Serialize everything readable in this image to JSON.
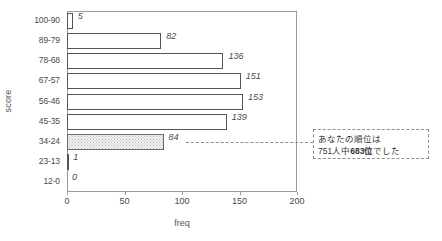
{
  "chart_data": {
    "type": "bar",
    "orientation": "horizontal",
    "title": "",
    "xlabel": "freq",
    "ylabel": "score",
    "categories": [
      "100-90",
      "89-79",
      "78-68",
      "67-57",
      "56-46",
      "45-35",
      "34-24",
      "23-13",
      "12-0"
    ],
    "values": [
      5,
      82,
      136,
      151,
      153,
      139,
      84,
      1,
      0
    ],
    "value_labels": [
      "5",
      "82",
      "136",
      "151",
      "153",
      "139",
      "84",
      "1",
      "0"
    ],
    "xlim": [
      0,
      200
    ],
    "xticks": [
      0,
      50,
      100,
      150,
      200
    ],
    "xtick_labels": [
      "0",
      "50",
      "100",
      "150",
      "200"
    ],
    "grid": false,
    "legend": null,
    "highlight_category": "34-24",
    "highlight_style": "stippled-gray-fill",
    "bar_fill": "#ffffff",
    "bar_edge": "#555555",
    "highlight_fill": "#f2f2f2",
    "annotation": {
      "line1": "あなたの順位は",
      "line2_prefix": "751人中",
      "line2_strong": "683位",
      "line2_suffix": "でした",
      "connector": "dashed-leader-line",
      "attached_to": "34-24"
    }
  }
}
